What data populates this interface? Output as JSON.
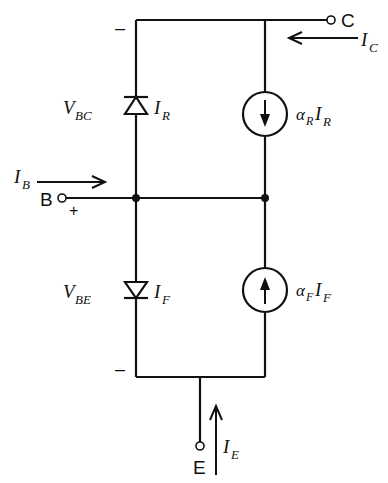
{
  "diagram": {
    "colors": {
      "stroke": "#111111",
      "background": "#ffffff"
    },
    "terminals": {
      "collector": {
        "label": "C"
      },
      "base": {
        "label": "B"
      },
      "emitter": {
        "label": "E"
      }
    },
    "polarity": {
      "top_minus": "–",
      "base_plus": "+",
      "bottom_minus": "–"
    },
    "currents": {
      "ic": {
        "main": "I",
        "sub": "C"
      },
      "ib": {
        "main": "I",
        "sub": "B"
      },
      "ie": {
        "main": "I",
        "sub": "E"
      }
    },
    "voltages": {
      "vbc": {
        "main": "V",
        "sub": "BC"
      },
      "vbe": {
        "main": "V",
        "sub": "BE"
      }
    },
    "diodes": {
      "upper": {
        "main": "I",
        "sub": "R",
        "direction": "up"
      },
      "lower": {
        "main": "I",
        "sub": "F",
        "direction": "down"
      }
    },
    "sources": {
      "upper": {
        "alpha": "α",
        "alpha_sub": "R",
        "main": "I",
        "sub": "R",
        "arrow": "down"
      },
      "lower": {
        "alpha": "α",
        "alpha_sub": "F",
        "main": "I",
        "sub": "F",
        "arrow": "up"
      }
    }
  }
}
